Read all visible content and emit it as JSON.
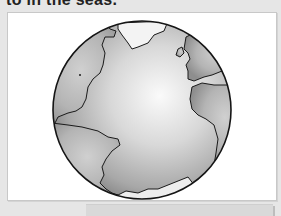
{
  "page": {
    "top_text": "to in the seas.",
    "figure": {
      "subject": "globe-illustration",
      "description": "Earth globe showing Atlantic Ocean with North America, South America, Europe and Africa outlines",
      "colors": {
        "background": "#e6e6e6",
        "frame": "#ffffff",
        "globe_light": "#f4f4f4",
        "globe_dark": "#8c8c8c",
        "land": "#b0b0b0",
        "outline": "#1a1a1a"
      }
    }
  }
}
